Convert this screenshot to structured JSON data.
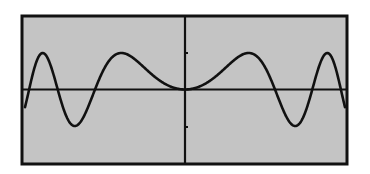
{
  "chart_data": {
    "type": "line",
    "title": "",
    "xlabel": "",
    "ylabel": "",
    "grid": false,
    "legend": null,
    "function": "y = sin(x^2) (even function, symmetric about y-axis)",
    "xlim": [
      -3.55,
      3.55
    ],
    "ylim": [
      -1.45,
      1.45
    ],
    "x_ticks": [],
    "y_ticks": [
      -1,
      1
    ],
    "series": [
      {
        "name": "f(x)",
        "description": "Oscillating even curve, flat at origin; peaks of +1 and troughs of -1, oscillation frequency increases with |x|",
        "key_points": {
          "peaks": [
            [
              -2.51,
              1
            ],
            [
              -1.25,
              1
            ],
            [
              1.25,
              1
            ],
            [
              2.51,
              1
            ]
          ],
          "troughs": [
            [
              -2.17,
              -1
            ],
            [
              2.17,
              -1
            ]
          ],
          "zero_crossings": [
            -3.07,
            -2.51,
            -1.77,
            0,
            1.77,
            2.51,
            3.07
          ],
          "endpoints": [
            [
              -3.15,
              -0.45
            ],
            [
              3.15,
              -0.45
            ]
          ]
        }
      }
    ],
    "colors": {
      "background": "#c4c4c4",
      "frame": "#111111",
      "axes": "#111111",
      "curve": "#111111"
    }
  },
  "layout": {
    "frame": {
      "x": 21,
      "y": 15,
      "width": 327,
      "height": 150
    },
    "origin_px": {
      "x": 185,
      "y": 89.5
    },
    "amplitude_px": 36.5,
    "k": 0.00038785,
    "u_max": 160,
    "tick_y_px": [
      53,
      127
    ]
  }
}
